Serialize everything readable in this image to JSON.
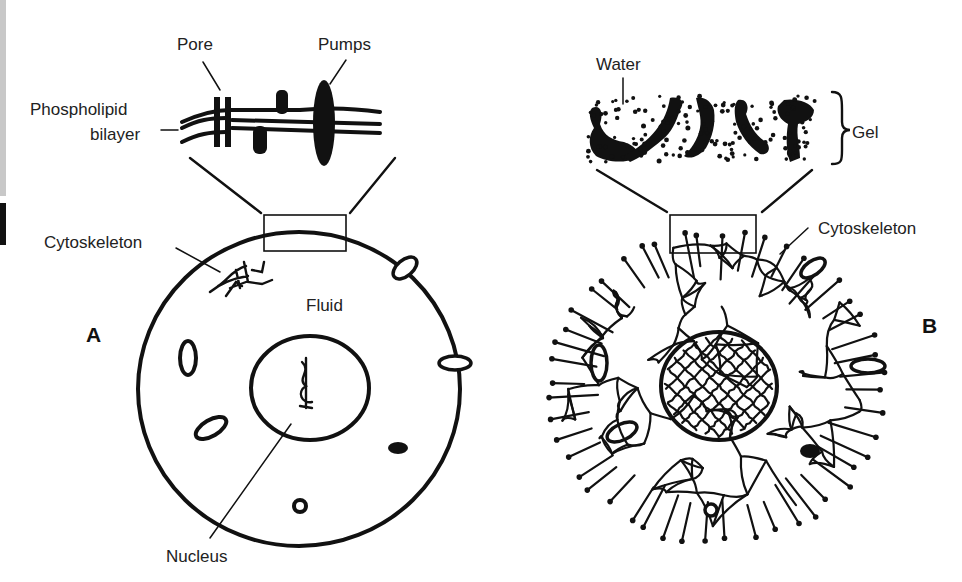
{
  "figure": {
    "panels": [
      {
        "id": "A",
        "panel_label": "A",
        "state_label": "Fluid",
        "labels": {
          "pore": "Pore",
          "pumps": "Pumps",
          "bilayer_line1": "Phospholipid",
          "bilayer_line2": "bilayer",
          "cytoskeleton": "Cytoskeleton",
          "nucleus": "Nucleus",
          "fluid": "Fluid"
        }
      },
      {
        "id": "B",
        "panel_label": "B",
        "labels": {
          "water": "Water",
          "gel": "Gel",
          "cytoskeleton": "Cytoskeleton"
        }
      }
    ],
    "colors": {
      "ink": "#111111",
      "background": "#ffffff",
      "edge_strip": "#c8c8c8"
    }
  }
}
